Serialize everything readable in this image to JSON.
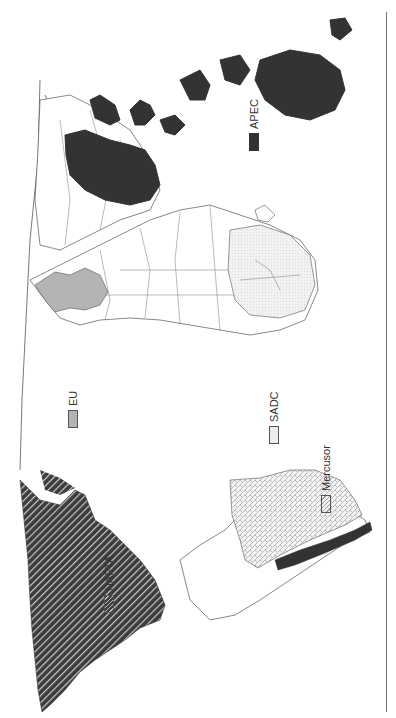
{
  "figure": {
    "type": "world-map",
    "orientation": "rotated 90deg clockwise"
  },
  "legend": {
    "items": [
      {
        "id": "nafta",
        "label": "NAFTA",
        "fill": "diagonal-hatch-dark",
        "color": "#3c3c3c"
      },
      {
        "id": "eu",
        "label": "EU",
        "fill": "solid-gray",
        "color": "#b4b4b4"
      },
      {
        "id": "sadc",
        "label": "SADC",
        "fill": "light-dotted",
        "color": "#ececec"
      },
      {
        "id": "mercusor",
        "label": "Mercusor",
        "fill": "crosshatch-light",
        "color": "#f3f3f3"
      },
      {
        "id": "apec",
        "label": "APEC",
        "fill": "solid-dark",
        "color": "#333333"
      }
    ]
  },
  "colors": {
    "outline": "#555555",
    "background": "#ffffff",
    "nafta": "#3c3c3c",
    "eu": "#b4b4b4",
    "sadc": "#ececec",
    "mercusor": "#f3f3f3",
    "apec": "#333333"
  }
}
